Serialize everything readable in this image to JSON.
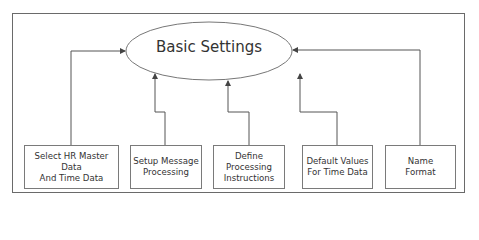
{
  "diagram": {
    "center_node": {
      "label": "Basic Settings"
    },
    "nodes": [
      {
        "lines": [
          "Select HR Master Data",
          "And Time Data"
        ]
      },
      {
        "lines": [
          "Setup Message",
          "Processing"
        ]
      },
      {
        "lines": [
          "Define Processing",
          "Instructions"
        ]
      },
      {
        "lines": [
          "Default Values",
          "For Time Data"
        ]
      },
      {
        "lines": [
          "Name",
          "Format"
        ]
      }
    ],
    "edges": [
      {
        "from": 0,
        "to": "center"
      },
      {
        "from": 1,
        "to": "center"
      },
      {
        "from": 2,
        "to": "center"
      },
      {
        "from": 3,
        "to": "center"
      },
      {
        "from": 4,
        "to": "center"
      }
    ],
    "colors": {
      "line": "#555555",
      "text": "#333333",
      "background": "#ffffff"
    }
  }
}
